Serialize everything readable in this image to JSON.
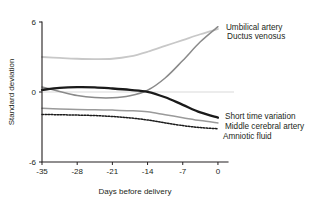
{
  "chart_data": {
    "type": "line",
    "title": "",
    "xlabel": "Days before delivery",
    "ylabel": "Standard deviation",
    "xlim": [
      -35,
      2
    ],
    "ylim": [
      -6,
      6
    ],
    "xticks": [
      -35,
      -28,
      -21,
      -14,
      -7,
      0
    ],
    "xticklabels": [
      "-35",
      "-28",
      "-21",
      "-14",
      "-7",
      "0"
    ],
    "yticks": [
      6,
      0,
      -6
    ],
    "yticklabels": [
      "6",
      "0",
      "-6"
    ],
    "grid": false,
    "legend_position": "inline-right-annotations",
    "reference_line_y": 0,
    "x": [
      -35,
      -31.5,
      -28,
      -24.5,
      -21,
      -17.5,
      -14,
      -10.5,
      -7,
      -3.5,
      0
    ],
    "series": [
      {
        "name": "Umbilical artery",
        "color": "#c8c8c8",
        "style": "solid",
        "width": 1.8,
        "values": [
          3.0,
          2.92,
          2.85,
          2.82,
          2.85,
          3.05,
          3.45,
          3.95,
          4.45,
          4.95,
          5.4
        ],
        "label_x": 0.8,
        "label_y": 5.6
      },
      {
        "name": "Ductus venosus",
        "color": "#8a8a8a",
        "style": "solid",
        "width": 1.5,
        "values": [
          0.42,
          0.05,
          -0.3,
          -0.48,
          -0.5,
          -0.32,
          0.15,
          1.2,
          2.7,
          4.3,
          5.6
        ],
        "label_x": 1.0,
        "label_y": 4.8
      },
      {
        "name": "Short time variation",
        "color": "#1a1a1a",
        "style": "solid",
        "width": 2.3,
        "values": [
          0.18,
          0.35,
          0.42,
          0.4,
          0.3,
          0.18,
          0.02,
          -0.45,
          -1.1,
          -1.75,
          -2.2
        ],
        "label_x": 0.6,
        "label_y": -2.05
      },
      {
        "name": "Middle cerebral artery",
        "color": "#9a9a9a",
        "style": "solid",
        "width": 1.5,
        "values": [
          -1.4,
          -1.45,
          -1.5,
          -1.52,
          -1.55,
          -1.6,
          -1.7,
          -1.95,
          -2.2,
          -2.45,
          -2.65
        ],
        "label_x": 0.6,
        "label_y": -2.95
      },
      {
        "name": "Amniotic fluid",
        "color": "#1a1a1a",
        "style": "dotted",
        "width": 1.5,
        "values": [
          -1.92,
          -1.95,
          -1.98,
          -2.02,
          -2.1,
          -2.22,
          -2.4,
          -2.65,
          -2.88,
          -3.05,
          -3.15
        ],
        "label_x": 0.2,
        "label_y": -3.75
      }
    ]
  }
}
